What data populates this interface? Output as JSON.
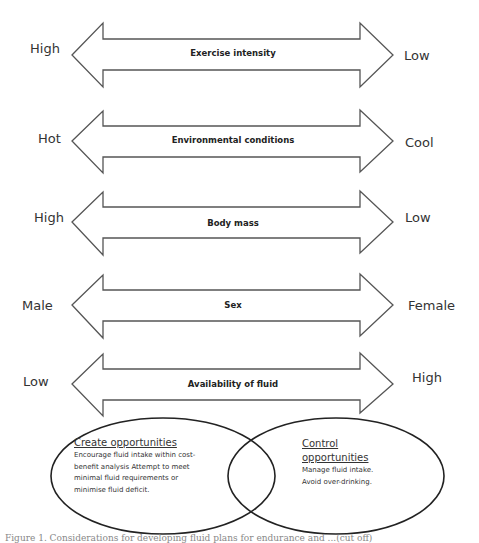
{
  "arrows": [
    {
      "label": "Exercise intensity",
      "left": "High",
      "right": "Low"
    },
    {
      "label": "Environmental conditions",
      "left": "Hot",
      "right": "Cool"
    },
    {
      "label": "Body mass",
      "left": "High",
      "right": "Low"
    },
    {
      "label": "Sex",
      "left": "Male",
      "right": "Female"
    },
    {
      "label": "Availability of fluid",
      "left": "Low",
      "right": "High"
    }
  ],
  "ellipses": {
    "left": {
      "title": "Create opportunities",
      "lines": [
        "Encourage fluid intake within cost-",
        "benefit analysis Attempt to meet",
        "minimal fluid requirements or",
        "minimise fluid deficit."
      ]
    },
    "right": {
      "title_lines": [
        "Control",
        "opportunities"
      ],
      "lines": [
        "Manage fluid intake.",
        "Avoid over-drinking."
      ]
    }
  },
  "caption": "Figure 1. Considerations for developing fluid plans for endurance and ...(cut off)"
}
